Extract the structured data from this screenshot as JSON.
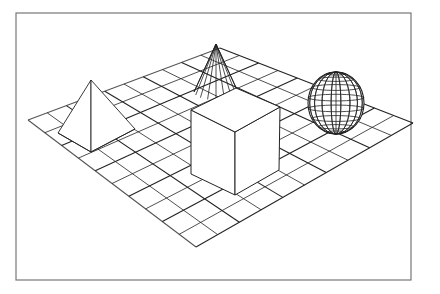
{
  "scene": {
    "description": "Wireframe 3D scene: pyramid, cone, cube and sphere on a checkered grid plane",
    "frame": {
      "x": 16,
      "y": 13,
      "width": 395,
      "height": 267,
      "stroke": "#777777"
    },
    "line_color": "#222222",
    "grid": {
      "divisions": 10,
      "corners": {
        "left": [
          28,
          120
        ],
        "back": [
          220,
          48
        ],
        "right": [
          413,
          123
        ],
        "front": [
          196,
          247
        ]
      }
    },
    "objects": [
      {
        "name": "pyramid",
        "apex": [
          91,
          80
        ],
        "base": [
          [
            58,
            133
          ],
          [
            91,
            152
          ],
          [
            135,
            129
          ],
          [
            95,
            113
          ]
        ]
      },
      {
        "name": "cone",
        "apex": [
          216,
          44
        ],
        "base_center": [
          216,
          92
        ],
        "base_rx": 22,
        "base_ry": 8,
        "rulings": 9
      },
      {
        "name": "cube",
        "top": [
          [
            191,
            110
          ],
          [
            235,
            132
          ],
          [
            280,
            107
          ],
          [
            236,
            88
          ]
        ],
        "bottom": [
          [
            191,
            174
          ],
          [
            235,
            195
          ],
          [
            279,
            170
          ]
        ]
      },
      {
        "name": "sphere",
        "center": [
          336,
          103
        ],
        "rx": 28,
        "ry": 31,
        "meridians": 9,
        "parallels": 9
      }
    ]
  }
}
